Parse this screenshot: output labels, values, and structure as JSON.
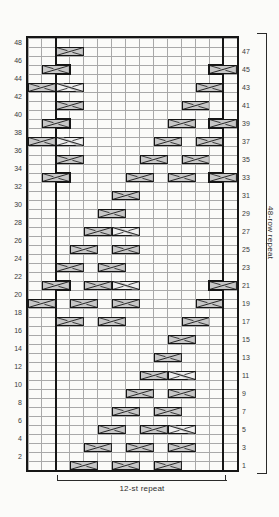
{
  "chart": {
    "type": "knitting-cable-chart",
    "columns": 15,
    "rows": 48,
    "stitch_repeat": {
      "label": "12-st repeat",
      "stitches": 12,
      "from_column": 3,
      "to_column": 14
    },
    "row_repeat": {
      "label": "48-row repeat",
      "rows": 48
    },
    "left_row_numbers": [
      "48",
      "46",
      "44",
      "42",
      "40",
      "38",
      "36",
      "34",
      "32",
      "30",
      "28",
      "26",
      "24",
      "22",
      "20",
      "18",
      "16",
      "14",
      "12",
      "10",
      "8",
      "6",
      "4",
      "2"
    ],
    "right_row_numbers": [
      "47",
      "45",
      "43",
      "41",
      "39",
      "37",
      "35",
      "33",
      "31",
      "29",
      "27",
      "25",
      "23",
      "21",
      "19",
      "17",
      "15",
      "13",
      "11",
      "9",
      "7",
      "5",
      "3",
      "1"
    ],
    "symbols": [
      {
        "row": 47,
        "col": 3,
        "type": "right-cross"
      },
      {
        "row": 45,
        "col": 2,
        "type": "right-cross"
      },
      {
        "row": 45,
        "col": 14,
        "type": "right-cross"
      },
      {
        "row": 43,
        "col": 1,
        "type": "right-cross"
      },
      {
        "row": 43,
        "col": 3,
        "type": "left-cross"
      },
      {
        "row": 43,
        "col": 13,
        "type": "right-cross"
      },
      {
        "row": 41,
        "col": 3,
        "type": "right-cross"
      },
      {
        "row": 41,
        "col": 12,
        "type": "right-cross"
      },
      {
        "row": 39,
        "col": 2,
        "type": "right-cross"
      },
      {
        "row": 39,
        "col": 11,
        "type": "right-cross"
      },
      {
        "row": 39,
        "col": 14,
        "type": "right-cross"
      },
      {
        "row": 37,
        "col": 1,
        "type": "right-cross"
      },
      {
        "row": 37,
        "col": 3,
        "type": "left-cross"
      },
      {
        "row": 37,
        "col": 10,
        "type": "right-cross"
      },
      {
        "row": 37,
        "col": 13,
        "type": "right-cross"
      },
      {
        "row": 35,
        "col": 3,
        "type": "right-cross"
      },
      {
        "row": 35,
        "col": 9,
        "type": "right-cross"
      },
      {
        "row": 35,
        "col": 12,
        "type": "right-cross"
      },
      {
        "row": 33,
        "col": 2,
        "type": "right-cross"
      },
      {
        "row": 33,
        "col": 8,
        "type": "right-cross"
      },
      {
        "row": 33,
        "col": 11,
        "type": "right-cross"
      },
      {
        "row": 33,
        "col": 14,
        "type": "right-cross"
      },
      {
        "row": 31,
        "col": 7,
        "type": "right-cross"
      },
      {
        "row": 29,
        "col": 6,
        "type": "right-cross"
      },
      {
        "row": 27,
        "col": 5,
        "type": "right-cross"
      },
      {
        "row": 27,
        "col": 7,
        "type": "left-cross"
      },
      {
        "row": 25,
        "col": 4,
        "type": "right-cross"
      },
      {
        "row": 25,
        "col": 7,
        "type": "right-cross"
      },
      {
        "row": 23,
        "col": 3,
        "type": "right-cross"
      },
      {
        "row": 23,
        "col": 6,
        "type": "right-cross"
      },
      {
        "row": 21,
        "col": 2,
        "type": "right-cross"
      },
      {
        "row": 21,
        "col": 5,
        "type": "right-cross"
      },
      {
        "row": 21,
        "col": 7,
        "type": "left-cross"
      },
      {
        "row": 21,
        "col": 14,
        "type": "right-cross"
      },
      {
        "row": 19,
        "col": 1,
        "type": "right-cross"
      },
      {
        "row": 19,
        "col": 4,
        "type": "right-cross"
      },
      {
        "row": 19,
        "col": 7,
        "type": "right-cross"
      },
      {
        "row": 19,
        "col": 13,
        "type": "right-cross"
      },
      {
        "row": 17,
        "col": 3,
        "type": "right-cross"
      },
      {
        "row": 17,
        "col": 6,
        "type": "right-cross"
      },
      {
        "row": 17,
        "col": 12,
        "type": "right-cross"
      },
      {
        "row": 15,
        "col": 11,
        "type": "right-cross"
      },
      {
        "row": 13,
        "col": 10,
        "type": "right-cross"
      },
      {
        "row": 11,
        "col": 9,
        "type": "right-cross"
      },
      {
        "row": 11,
        "col": 11,
        "type": "left-cross"
      },
      {
        "row": 9,
        "col": 8,
        "type": "right-cross"
      },
      {
        "row": 9,
        "col": 11,
        "type": "right-cross"
      },
      {
        "row": 7,
        "col": 7,
        "type": "right-cross"
      },
      {
        "row": 7,
        "col": 10,
        "type": "right-cross"
      },
      {
        "row": 5,
        "col": 6,
        "type": "right-cross"
      },
      {
        "row": 5,
        "col": 9,
        "type": "right-cross"
      },
      {
        "row": 5,
        "col": 11,
        "type": "left-cross"
      },
      {
        "row": 3,
        "col": 5,
        "type": "right-cross"
      },
      {
        "row": 3,
        "col": 8,
        "type": "right-cross"
      },
      {
        "row": 3,
        "col": 11,
        "type": "right-cross"
      },
      {
        "row": 1,
        "col": 4,
        "type": "right-cross"
      },
      {
        "row": 1,
        "col": 7,
        "type": "right-cross"
      },
      {
        "row": 1,
        "col": 10,
        "type": "right-cross"
      }
    ],
    "colors": {
      "background": "#fbfbf9",
      "grid_line": "#a9a9a9",
      "bold_line": "#161616",
      "symbol_fill_dark": "#c7c7c7",
      "symbol_fill_light": "#efefef",
      "text": "#3a3a3a"
    }
  }
}
